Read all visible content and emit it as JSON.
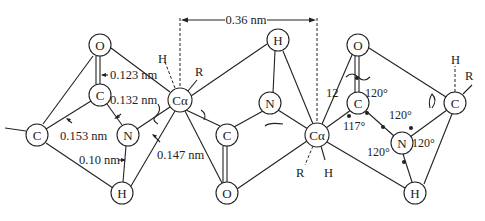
{
  "diagram": {
    "type": "peptide-bond-geometry",
    "atoms": [
      {
        "id": "O1",
        "label": "O",
        "x": 100,
        "y": 45
      },
      {
        "id": "C1",
        "label": "C",
        "x": 100,
        "y": 95
      },
      {
        "id": "C0",
        "label": "C",
        "x": 37,
        "y": 135
      },
      {
        "id": "N1",
        "label": "N",
        "x": 128,
        "y": 135
      },
      {
        "id": "H1",
        "label": "H",
        "x": 122,
        "y": 193
      },
      {
        "id": "Ca1",
        "label": "Cα",
        "x": 180,
        "y": 100
      },
      {
        "id": "H2",
        "label": "H",
        "x": 278,
        "y": 40
      },
      {
        "id": "N2",
        "label": "N",
        "x": 270,
        "y": 103
      },
      {
        "id": "C2",
        "label": "C",
        "x": 227,
        "y": 135
      },
      {
        "id": "O2",
        "label": "O",
        "x": 227,
        "y": 193
      },
      {
        "id": "Ca2",
        "label": "Cα",
        "x": 317,
        "y": 135
      },
      {
        "id": "O3",
        "label": "O",
        "x": 358,
        "y": 45
      },
      {
        "id": "C3",
        "label": "C",
        "x": 358,
        "y": 103
      },
      {
        "id": "N3",
        "label": "N",
        "x": 402,
        "y": 143
      },
      {
        "id": "C4",
        "label": "C",
        "x": 455,
        "y": 103
      },
      {
        "id": "H3",
        "label": "H",
        "x": 415,
        "y": 193
      }
    ],
    "bond_lengths": {
      "c_o": "0.123 nm",
      "c_n": "0.132 nm",
      "c_c": "0.153 nm",
      "n_h": "0.10 nm",
      "n_ca": "0.147 nm",
      "repeat": "0.36 nm"
    },
    "angles": {
      "a1": "120°",
      "a2": "117°",
      "a3": "120°",
      "a4": "120°",
      "a5": "120°"
    },
    "substituents": {
      "ca1_h": "H",
      "ca1_r": "R",
      "ca2_r": "R",
      "ca2_h": "H",
      "c4_h": "H",
      "c4_r": "R",
      "partial_label": "12"
    }
  }
}
